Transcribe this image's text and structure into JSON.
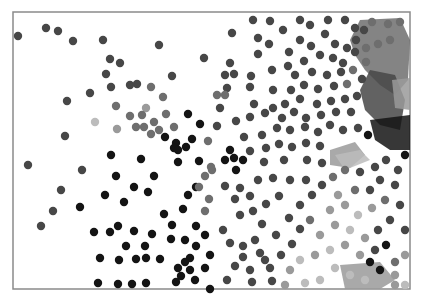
{
  "canvas": {
    "width": 422,
    "height": 302,
    "background": "#ffffff"
  },
  "frame": {
    "x": 13,
    "y": 12,
    "width": 397,
    "height": 277,
    "stroke": "#8a8a8a"
  },
  "palette": {
    "black": "#141414",
    "dark": "#2e2e2e",
    "mid_dark": "#474747",
    "mid": "#6e6e6e",
    "light": "#9a9a9a",
    "pale": "#bcbcbc"
  },
  "dot_radius": 4.2,
  "blobs": [
    {
      "shade": "mid",
      "points": "360,20 400,18 410,40 408,80 395,95 380,85 365,70 355,55 350,40"
    },
    {
      "shade": "mid_dark",
      "points": "370,70 395,75 405,100 400,130 380,125 365,110 360,90"
    },
    {
      "shade": "light",
      "points": "392,80 410,78 410,110 395,108"
    },
    {
      "shade": "light",
      "points": "330,150 355,142 365,155 350,168 330,165"
    },
    {
      "shade": "pale",
      "points": "335,155 360,150 370,160 345,170"
    },
    {
      "shade": "light",
      "points": "340,265 380,262 395,280 380,289 345,289"
    },
    {
      "shade": "black",
      "points": "370,120 410,115 410,150 390,150 375,140"
    }
  ],
  "dots": [
    [
      18,
      36,
      "mid_dark"
    ],
    [
      46,
      28,
      "mid_dark"
    ],
    [
      58,
      31,
      "mid_dark"
    ],
    [
      73,
      41,
      "mid_dark"
    ],
    [
      103,
      40,
      "mid_dark"
    ],
    [
      159,
      45,
      "mid_dark"
    ],
    [
      204,
      58,
      "mid_dark"
    ],
    [
      110,
      59,
      "mid_dark"
    ],
    [
      120,
      63,
      "mid_dark"
    ],
    [
      106,
      74,
      "mid_dark"
    ],
    [
      111,
      87,
      "mid_dark"
    ],
    [
      130,
      85,
      "mid_dark"
    ],
    [
      137,
      84,
      "mid_dark"
    ],
    [
      90,
      93,
      "mid_dark"
    ],
    [
      67,
      101,
      "mid_dark"
    ],
    [
      172,
      76,
      "mid_dark"
    ],
    [
      151,
      87,
      "mid"
    ],
    [
      163,
      97,
      "mid"
    ],
    [
      116,
      106,
      "mid"
    ],
    [
      146,
      108,
      "light"
    ],
    [
      130,
      116,
      "mid"
    ],
    [
      142,
      115,
      "mid"
    ],
    [
      95,
      122,
      "pale"
    ],
    [
      117,
      129,
      "light"
    ],
    [
      136,
      127,
      "mid"
    ],
    [
      144,
      127,
      "mid"
    ],
    [
      154,
      122,
      "mid"
    ],
    [
      159,
      130,
      "mid"
    ],
    [
      151,
      134,
      "mid"
    ],
    [
      174,
      127,
      "mid"
    ],
    [
      166,
      114,
      "mid"
    ],
    [
      188,
      114,
      "black"
    ],
    [
      200,
      124,
      "black"
    ],
    [
      192,
      139,
      "black"
    ],
    [
      176,
      143,
      "black"
    ],
    [
      165,
      137,
      "black"
    ],
    [
      186,
      147,
      "black"
    ],
    [
      174,
      148,
      "black"
    ],
    [
      178,
      150,
      "black"
    ],
    [
      208,
      141,
      "mid"
    ],
    [
      65,
      136,
      "mid_dark"
    ],
    [
      28,
      165,
      "mid_dark"
    ],
    [
      82,
      170,
      "mid_dark"
    ],
    [
      61,
      190,
      "mid_dark"
    ],
    [
      41,
      226,
      "mid_dark"
    ],
    [
      53,
      211,
      "mid_dark"
    ],
    [
      80,
      207,
      "black"
    ],
    [
      111,
      155,
      "black"
    ],
    [
      141,
      159,
      "black"
    ],
    [
      178,
      162,
      "black"
    ],
    [
      154,
      176,
      "black"
    ],
    [
      116,
      176,
      "black"
    ],
    [
      134,
      187,
      "black"
    ],
    [
      148,
      192,
      "black"
    ],
    [
      124,
      202,
      "black"
    ],
    [
      105,
      195,
      "black"
    ],
    [
      94,
      232,
      "black"
    ],
    [
      110,
      232,
      "black"
    ],
    [
      118,
      226,
      "black"
    ],
    [
      134,
      231,
      "black"
    ],
    [
      152,
      234,
      "black"
    ],
    [
      172,
      225,
      "black"
    ],
    [
      183,
      209,
      "black"
    ],
    [
      164,
      214,
      "black"
    ],
    [
      171,
      239,
      "black"
    ],
    [
      126,
      246,
      "black"
    ],
    [
      145,
      246,
      "black"
    ],
    [
      100,
      258,
      "black"
    ],
    [
      119,
      260,
      "black"
    ],
    [
      136,
      259,
      "black"
    ],
    [
      146,
      258,
      "black"
    ],
    [
      160,
      259,
      "black"
    ],
    [
      178,
      268,
      "black"
    ],
    [
      190,
      258,
      "black"
    ],
    [
      196,
      246,
      "black"
    ],
    [
      185,
      240,
      "black"
    ],
    [
      98,
      283,
      "black"
    ],
    [
      118,
      284,
      "black"
    ],
    [
      132,
      284,
      "black"
    ],
    [
      146,
      283,
      "black"
    ],
    [
      185,
      262,
      "black"
    ],
    [
      190,
      270,
      "black"
    ],
    [
      181,
      276,
      "black"
    ],
    [
      176,
      282,
      "black"
    ],
    [
      195,
      280,
      "black"
    ],
    [
      205,
      268,
      "black"
    ],
    [
      210,
      255,
      "black"
    ],
    [
      205,
      235,
      "black"
    ],
    [
      196,
      226,
      "black"
    ],
    [
      188,
      195,
      "black"
    ],
    [
      196,
      187,
      "black"
    ],
    [
      212,
      170,
      "mid"
    ],
    [
      205,
      176,
      "mid"
    ],
    [
      199,
      187,
      "mid"
    ],
    [
      209,
      199,
      "mid"
    ],
    [
      205,
      211,
      "mid"
    ],
    [
      211,
      167,
      "mid"
    ],
    [
      199,
      161,
      "black"
    ],
    [
      225,
      160,
      "black"
    ],
    [
      234,
      158,
      "black"
    ],
    [
      230,
      150,
      "black"
    ],
    [
      243,
      160,
      "black"
    ],
    [
      236,
      170,
      "black"
    ],
    [
      225,
      186,
      "mid_dark"
    ],
    [
      240,
      188,
      "mid_dark"
    ],
    [
      235,
      199,
      "mid_dark"
    ],
    [
      250,
      196,
      "mid_dark"
    ],
    [
      240,
      215,
      "mid_dark"
    ],
    [
      253,
      211,
      "mid_dark"
    ],
    [
      266,
      204,
      "mid_dark"
    ],
    [
      279,
      196,
      "mid_dark"
    ],
    [
      262,
      224,
      "mid_dark"
    ],
    [
      276,
      235,
      "mid_dark"
    ],
    [
      255,
      240,
      "mid_dark"
    ],
    [
      243,
      246,
      "mid_dark"
    ],
    [
      260,
      253,
      "mid_dark"
    ],
    [
      235,
      266,
      "mid_dark"
    ],
    [
      250,
      270,
      "mid_dark"
    ],
    [
      270,
      268,
      "mid_dark"
    ],
    [
      281,
      255,
      "mid_dark"
    ],
    [
      292,
      244,
      "mid_dark"
    ],
    [
      300,
      229,
      "mid_dark"
    ],
    [
      289,
      218,
      "mid_dark"
    ],
    [
      300,
      205,
      "mid_dark"
    ],
    [
      312,
      195,
      "mid_dark"
    ],
    [
      322,
      185,
      "mid_dark"
    ],
    [
      306,
      180,
      "mid_dark"
    ],
    [
      290,
      180,
      "mid_dark"
    ],
    [
      273,
      178,
      "mid_dark"
    ],
    [
      258,
      180,
      "mid_dark"
    ],
    [
      223,
      230,
      "mid_dark"
    ],
    [
      230,
      243,
      "mid_dark"
    ],
    [
      227,
      280,
      "mid_dark"
    ],
    [
      252,
      282,
      "mid_dark"
    ],
    [
      272,
      281,
      "mid_dark"
    ],
    [
      243,
      257,
      "mid_dark"
    ],
    [
      265,
      260,
      "mid_dark"
    ],
    [
      210,
      289,
      "black"
    ],
    [
      253,
      20,
      "mid_dark"
    ],
    [
      270,
      21,
      "mid_dark"
    ],
    [
      232,
      33,
      "mid_dark"
    ],
    [
      258,
      38,
      "mid_dark"
    ],
    [
      283,
      30,
      "mid_dark"
    ],
    [
      300,
      20,
      "mid_dark"
    ],
    [
      310,
      25,
      "mid_dark"
    ],
    [
      328,
      20,
      "mid_dark"
    ],
    [
      345,
      20,
      "mid_dark"
    ],
    [
      355,
      28,
      "mid_dark"
    ],
    [
      300,
      40,
      "mid_dark"
    ],
    [
      289,
      52,
      "mid_dark"
    ],
    [
      311,
      46,
      "mid_dark"
    ],
    [
      325,
      34,
      "mid_dark"
    ],
    [
      335,
      44,
      "mid_dark"
    ],
    [
      347,
      48,
      "mid_dark"
    ],
    [
      356,
      40,
      "mid_dark"
    ],
    [
      364,
      30,
      "mid_dark"
    ],
    [
      372,
      22,
      "mid"
    ],
    [
      388,
      24,
      "mid"
    ],
    [
      400,
      22,
      "mid"
    ],
    [
      258,
      54,
      "mid_dark"
    ],
    [
      269,
      44,
      "mid_dark"
    ],
    [
      288,
      66,
      "mid_dark"
    ],
    [
      304,
      61,
      "mid_dark"
    ],
    [
      320,
      55,
      "mid_dark"
    ],
    [
      333,
      58,
      "mid_dark"
    ],
    [
      343,
      63,
      "mid_dark"
    ],
    [
      355,
      52,
      "mid_dark"
    ],
    [
      366,
      48,
      "mid"
    ],
    [
      378,
      44,
      "mid"
    ],
    [
      390,
      40,
      "mid"
    ],
    [
      230,
      63,
      "mid_dark"
    ],
    [
      251,
      76,
      "mid_dark"
    ],
    [
      272,
      70,
      "mid_dark"
    ],
    [
      295,
      75,
      "mid_dark"
    ],
    [
      312,
      72,
      "mid_dark"
    ],
    [
      327,
      75,
      "mid_dark"
    ],
    [
      341,
      72,
      "mid_dark"
    ],
    [
      353,
      70,
      "mid"
    ],
    [
      366,
      62,
      "mid"
    ],
    [
      225,
      75,
      "mid_dark"
    ],
    [
      234,
      74,
      "mid_dark"
    ],
    [
      227,
      88,
      "mid_dark"
    ],
    [
      217,
      95,
      "mid"
    ],
    [
      225,
      95,
      "mid"
    ],
    [
      250,
      87,
      "mid_dark"
    ],
    [
      273,
      90,
      "mid_dark"
    ],
    [
      291,
      90,
      "mid_dark"
    ],
    [
      304,
      85,
      "mid_dark"
    ],
    [
      318,
      89,
      "mid_dark"
    ],
    [
      334,
      86,
      "mid_dark"
    ],
    [
      347,
      84,
      "mid"
    ],
    [
      362,
      79,
      "mid_dark"
    ],
    [
      220,
      108,
      "mid_dark"
    ],
    [
      254,
      104,
      "mid_dark"
    ],
    [
      273,
      108,
      "mid_dark"
    ],
    [
      285,
      104,
      "mid_dark"
    ],
    [
      300,
      99,
      "mid_dark"
    ],
    [
      317,
      104,
      "mid_dark"
    ],
    [
      331,
      101,
      "mid_dark"
    ],
    [
      345,
      99,
      "mid_dark"
    ],
    [
      357,
      96,
      "mid_dark"
    ],
    [
      217,
      126,
      "mid_dark"
    ],
    [
      236,
      121,
      "mid_dark"
    ],
    [
      250,
      117,
      "mid_dark"
    ],
    [
      265,
      113,
      "mid_dark"
    ],
    [
      282,
      118,
      "mid_dark"
    ],
    [
      294,
      112,
      "mid_dark"
    ],
    [
      306,
      118,
      "mid_dark"
    ],
    [
      321,
      115,
      "mid_dark"
    ],
    [
      336,
      112,
      "mid_dark"
    ],
    [
      351,
      112,
      "mid_dark"
    ],
    [
      262,
      135,
      "mid_dark"
    ],
    [
      244,
      137,
      "mid_dark"
    ],
    [
      277,
      128,
      "mid_dark"
    ],
    [
      290,
      130,
      "mid_dark"
    ],
    [
      305,
      127,
      "mid_dark"
    ],
    [
      318,
      132,
      "mid_dark"
    ],
    [
      330,
      125,
      "mid_dark"
    ],
    [
      343,
      130,
      "mid_dark"
    ],
    [
      358,
      128,
      "mid_dark"
    ],
    [
      368,
      135,
      "black"
    ],
    [
      250,
      151,
      "mid_dark"
    ],
    [
      266,
      148,
      "mid_dark"
    ],
    [
      279,
      144,
      "mid_dark"
    ],
    [
      292,
      147,
      "mid_dark"
    ],
    [
      306,
      143,
      "mid_dark"
    ],
    [
      320,
      146,
      "mid_dark"
    ],
    [
      307,
      160,
      "mid_dark"
    ],
    [
      322,
      163,
      "mid_dark"
    ],
    [
      284,
      160,
      "mid_dark"
    ],
    [
      264,
      162,
      "mid_dark"
    ],
    [
      333,
      177,
      "mid"
    ],
    [
      345,
      170,
      "mid"
    ],
    [
      360,
      172,
      "mid_dark"
    ],
    [
      375,
      167,
      "mid_dark"
    ],
    [
      386,
      160,
      "mid_dark"
    ],
    [
      398,
      170,
      "mid_dark"
    ],
    [
      405,
      155,
      "black"
    ],
    [
      380,
      180,
      "mid_dark"
    ],
    [
      395,
      185,
      "mid_dark"
    ],
    [
      370,
      190,
      "mid_dark"
    ],
    [
      355,
      190,
      "mid"
    ],
    [
      338,
      195,
      "light"
    ],
    [
      330,
      210,
      "light"
    ],
    [
      345,
      205,
      "light"
    ],
    [
      358,
      215,
      "pale"
    ],
    [
      372,
      208,
      "light"
    ],
    [
      385,
      200,
      "mid"
    ],
    [
      400,
      205,
      "mid_dark"
    ],
    [
      390,
      220,
      "mid_dark"
    ],
    [
      405,
      230,
      "mid_dark"
    ],
    [
      378,
      230,
      "mid_dark"
    ],
    [
      365,
      238,
      "light"
    ],
    [
      350,
      230,
      "pale"
    ],
    [
      335,
      225,
      "light"
    ],
    [
      320,
      235,
      "light"
    ],
    [
      310,
      220,
      "mid"
    ],
    [
      300,
      260,
      "pale"
    ],
    [
      315,
      255,
      "light"
    ],
    [
      330,
      250,
      "pale"
    ],
    [
      345,
      245,
      "light"
    ],
    [
      360,
      255,
      "light"
    ],
    [
      375,
      250,
      "mid_dark"
    ],
    [
      386,
      245,
      "black"
    ],
    [
      370,
      262,
      "black"
    ],
    [
      380,
      270,
      "black"
    ],
    [
      395,
      262,
      "mid"
    ],
    [
      405,
      255,
      "light"
    ],
    [
      395,
      275,
      "light"
    ],
    [
      365,
      280,
      "pale"
    ],
    [
      350,
      275,
      "pale"
    ],
    [
      335,
      268,
      "pale"
    ],
    [
      320,
      280,
      "pale"
    ],
    [
      305,
      283,
      "pale"
    ],
    [
      290,
      270,
      "light"
    ],
    [
      285,
      285,
      "light"
    ],
    [
      395,
      285,
      "light"
    ],
    [
      405,
      285,
      "pale"
    ]
  ]
}
